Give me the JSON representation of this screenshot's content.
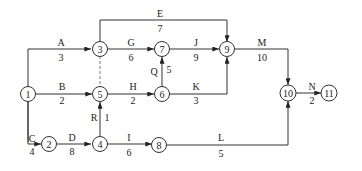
{
  "diagram": {
    "type": "activity-on-arrow network",
    "nodes": [
      {
        "id": "1",
        "label": "1"
      },
      {
        "id": "2",
        "label": "2"
      },
      {
        "id": "3",
        "label": "3"
      },
      {
        "id": "4",
        "label": "4"
      },
      {
        "id": "5",
        "label": "5"
      },
      {
        "id": "6",
        "label": "6"
      },
      {
        "id": "7",
        "label": "7"
      },
      {
        "id": "8",
        "label": "8"
      },
      {
        "id": "9",
        "label": "9"
      },
      {
        "id": "10",
        "label": "10"
      },
      {
        "id": "11",
        "label": "11"
      }
    ],
    "activities": [
      {
        "name": "A",
        "duration": "3",
        "from": "1",
        "to": "3"
      },
      {
        "name": "B",
        "duration": "2",
        "from": "1",
        "to": "5"
      },
      {
        "name": "C",
        "duration": "4",
        "from": "1",
        "to": "2"
      },
      {
        "name": "D",
        "duration": "8",
        "from": "2",
        "to": "4"
      },
      {
        "name": "E",
        "duration": "7",
        "from": "3",
        "to": "9"
      },
      {
        "name": "G",
        "duration": "6",
        "from": "3",
        "to": "7"
      },
      {
        "name": "H",
        "duration": "2",
        "from": "5",
        "to": "6"
      },
      {
        "name": "I",
        "duration": "6",
        "from": "4",
        "to": "8"
      },
      {
        "name": "J",
        "duration": "9",
        "from": "7",
        "to": "9"
      },
      {
        "name": "K",
        "duration": "3",
        "from": "6",
        "to": "9"
      },
      {
        "name": "L",
        "duration": "5",
        "from": "8",
        "to": "10"
      },
      {
        "name": "M",
        "duration": "10",
        "from": "9",
        "to": "10"
      },
      {
        "name": "N",
        "duration": "2",
        "from": "10",
        "to": "11"
      },
      {
        "name": "Q",
        "duration": "5",
        "from": "6",
        "to": "7"
      },
      {
        "name": "R",
        "duration": "1",
        "from": "4",
        "to": "5"
      }
    ],
    "dummies": [
      {
        "from": "3",
        "to": "5",
        "style": "dashed"
      }
    ]
  }
}
